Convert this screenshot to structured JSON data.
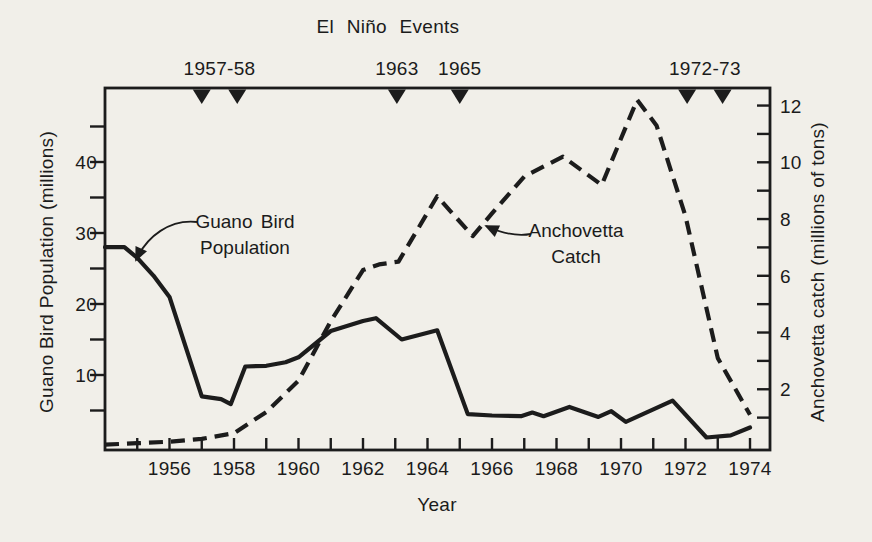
{
  "figure": {
    "background_color": "#f1efe9",
    "ink_color": "#1c1c1c"
  },
  "chart_data": {
    "type": "line",
    "title": "El Niño Events",
    "xlabel": "Year",
    "x_axis": {
      "range": [
        1954,
        1974.62
      ],
      "ticks": [
        1955,
        1956,
        1957,
        1958,
        1959,
        1960,
        1961,
        1962,
        1963,
        1964,
        1965,
        1966,
        1967,
        1968,
        1969,
        1970,
        1971,
        1972,
        1973,
        1974
      ],
      "tick_labels": [
        [
          1956,
          "1956"
        ],
        [
          1958,
          "1958"
        ],
        [
          1960,
          "1960"
        ],
        [
          1962,
          "1962"
        ],
        [
          1964,
          "1964"
        ],
        [
          1966,
          "1966"
        ],
        [
          1968,
          "1968"
        ],
        [
          1970,
          "1970"
        ],
        [
          1972,
          "1972"
        ],
        [
          1974,
          "1974"
        ]
      ]
    },
    "y_left": {
      "label": "Guano Bird Population (millions)",
      "range": [
        0,
        50.4
      ],
      "ticks": [
        5,
        10,
        15,
        20,
        25,
        30,
        35,
        40,
        45
      ],
      "tick_labels": [
        [
          10,
          "10"
        ],
        [
          20,
          "20"
        ],
        [
          30,
          "30"
        ],
        [
          40,
          "40"
        ]
      ]
    },
    "y_right": {
      "label": "Anchovetta catch (millions of tons)",
      "range": [
        0,
        12.6
      ],
      "ticks": [
        1,
        2,
        3,
        4,
        5,
        6,
        7,
        8,
        9,
        10,
        11,
        12
      ],
      "tick_labels": [
        [
          2,
          "2"
        ],
        [
          4,
          "4"
        ],
        [
          6,
          "6"
        ],
        [
          8,
          "8"
        ],
        [
          10,
          "10"
        ],
        [
          12,
          "12"
        ]
      ]
    },
    "el_nino_events": [
      {
        "label": "1957-58",
        "marker_years": [
          1957.0,
          1958.1
        ]
      },
      {
        "label": "1963",
        "marker_years": [
          1963.05
        ]
      },
      {
        "label": "1965",
        "marker_years": [
          1965.0
        ]
      },
      {
        "label": "1972-73",
        "marker_years": [
          1972.05,
          1973.15
        ]
      }
    ],
    "series": [
      {
        "name": "Guano Bird Population",
        "axis": "left",
        "unit": "millions",
        "line_style": "solid",
        "points": [
          [
            1954.0,
            28
          ],
          [
            1954.6,
            28
          ],
          [
            1955.0,
            26.5
          ],
          [
            1955.5,
            24
          ],
          [
            1956.0,
            21
          ],
          [
            1956.5,
            14
          ],
          [
            1957.0,
            7
          ],
          [
            1957.6,
            6.6
          ],
          [
            1957.9,
            5.9
          ],
          [
            1958.35,
            11.2
          ],
          [
            1959.0,
            11.3
          ],
          [
            1959.6,
            11.8
          ],
          [
            1960.0,
            12.5
          ],
          [
            1961.0,
            16.2
          ],
          [
            1962.0,
            17.6
          ],
          [
            1962.4,
            18
          ],
          [
            1963.2,
            15
          ],
          [
            1964.3,
            16.3
          ],
          [
            1965.25,
            4.5
          ],
          [
            1966.0,
            4.3
          ],
          [
            1966.9,
            4.2
          ],
          [
            1967.25,
            4.7
          ],
          [
            1967.6,
            4.2
          ],
          [
            1968.4,
            5.5
          ],
          [
            1969.3,
            4.1
          ],
          [
            1969.7,
            4.9
          ],
          [
            1970.15,
            3.4
          ],
          [
            1971.6,
            6.4
          ],
          [
            1972.65,
            1.2
          ],
          [
            1973.4,
            1.5
          ],
          [
            1974.0,
            2.6
          ]
        ]
      },
      {
        "name": "Anchovetta Catch",
        "axis": "right",
        "unit": "millions of tons",
        "line_style": "dashed",
        "points": [
          [
            1954.0,
            0.05
          ],
          [
            1955.0,
            0.1
          ],
          [
            1956.0,
            0.15
          ],
          [
            1957.0,
            0.25
          ],
          [
            1958.0,
            0.45
          ],
          [
            1959.0,
            1.2
          ],
          [
            1960.0,
            2.3
          ],
          [
            1961.0,
            4.4
          ],
          [
            1962.0,
            6.2
          ],
          [
            1962.5,
            6.4
          ],
          [
            1963.1,
            6.5
          ],
          [
            1964.3,
            8.8
          ],
          [
            1965.4,
            7.4
          ],
          [
            1966.0,
            8.2
          ],
          [
            1967.0,
            9.5
          ],
          [
            1968.2,
            10.2
          ],
          [
            1969.4,
            9.2
          ],
          [
            1970.5,
            12.2
          ],
          [
            1971.1,
            11.3
          ],
          [
            1972.0,
            8.1
          ],
          [
            1973.0,
            3.1
          ],
          [
            1974.0,
            1.1
          ]
        ]
      }
    ],
    "annotations": [
      {
        "lines": [
          "Guano Bird",
          "Population"
        ],
        "target_series": "Guano Bird Population"
      },
      {
        "lines": [
          "Anchovetta",
          "Catch"
        ],
        "target_series": "Anchovetta Catch"
      }
    ]
  }
}
